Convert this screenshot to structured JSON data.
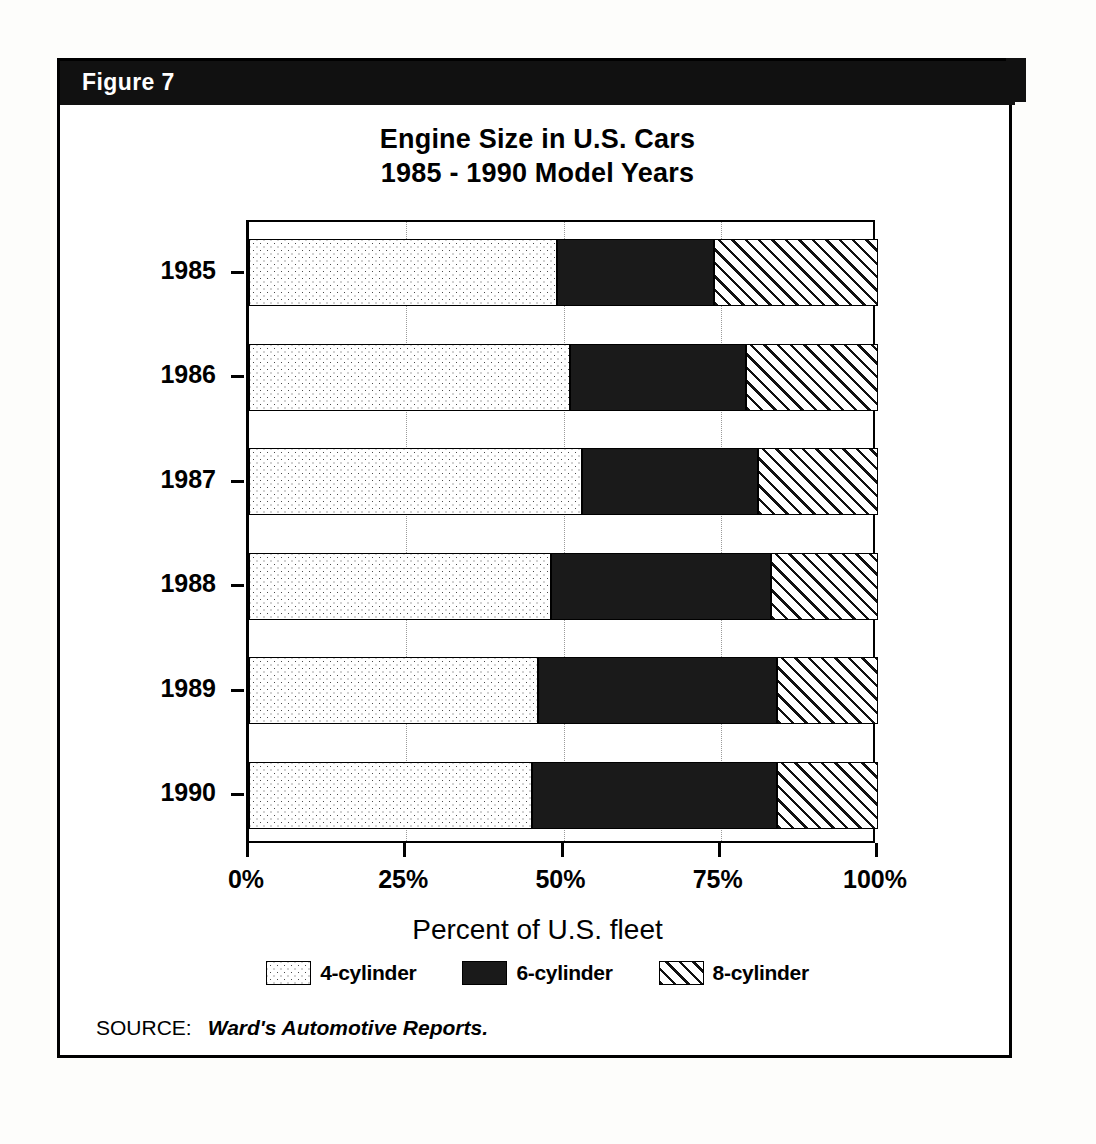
{
  "figure": {
    "header_label": "Figure 7",
    "header_bg": "#111111",
    "header_fg": "#ffffff"
  },
  "source": {
    "label": "SOURCE:",
    "text": "Ward's Automotive Reports."
  },
  "legend": {
    "position": "bottom",
    "items": [
      {
        "label": "4-cylinder",
        "pattern": "dotted",
        "swatch_name": "legend-swatch-4cyl"
      },
      {
        "label": "6-cylinder",
        "pattern": "solid-black",
        "swatch_name": "legend-swatch-6cyl"
      },
      {
        "label": "8-cylinder",
        "pattern": "diagonal-hatch",
        "swatch_name": "legend-swatch-8cyl"
      }
    ]
  },
  "chart_data": {
    "type": "bar",
    "orientation": "horizontal",
    "stacked": true,
    "title": "Engine Size in U.S. Cars",
    "subtitle": "1985 - 1990 Model Years",
    "xlabel": "Percent of U.S. fleet",
    "ylabel": "",
    "xlim": [
      0,
      100
    ],
    "xticks": [
      0,
      25,
      50,
      75,
      100
    ],
    "xticklabels": [
      "0%",
      "25%",
      "50%",
      "75%",
      "100%"
    ],
    "categories": [
      "1985",
      "1986",
      "1987",
      "1988",
      "1989",
      "1990"
    ],
    "grid": true,
    "series": [
      {
        "name": "4-cylinder",
        "pattern": "dotted",
        "values": [
          49,
          51,
          53,
          48,
          46,
          45
        ]
      },
      {
        "name": "6-cylinder",
        "pattern": "solid-black",
        "values": [
          25,
          28,
          28,
          35,
          38,
          39
        ]
      },
      {
        "name": "8-cylinder",
        "pattern": "diagonal-hatch",
        "values": [
          26,
          21,
          19,
          17,
          16,
          16
        ]
      }
    ]
  }
}
